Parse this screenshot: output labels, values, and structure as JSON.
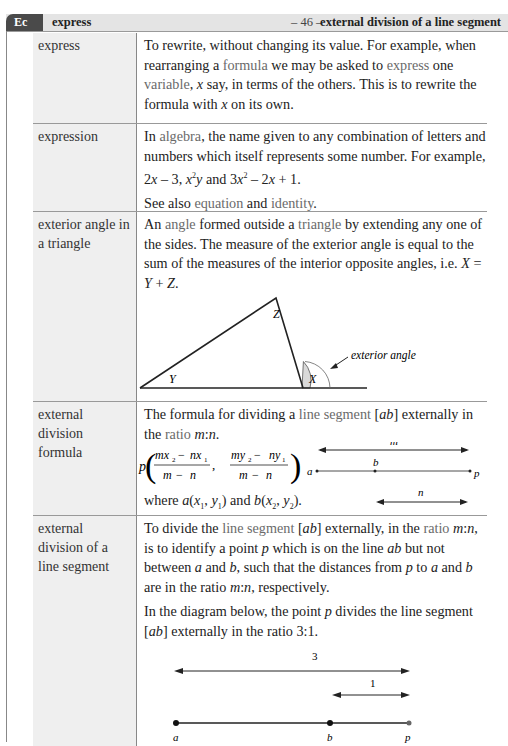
{
  "header": {
    "tab_label": "Ec",
    "left_word": "express",
    "page_number": "– 46 –",
    "right_word": "external division of a line segment"
  },
  "entries": [
    {
      "term": "express",
      "definition": "To rewrite, without changing its value. For example, when rearranging a formula we may be asked to express one variable, x say, in terms of the others. This is to rewrite the formula with x on its own.",
      "xrefs": [
        "formula",
        "express",
        "variable"
      ]
    },
    {
      "term": "expression",
      "definition": "In algebra, the name given to any combination of letters and numbers which itself represents some number. For example, 2x − 3, x²y and 3x² − 2x + 1.",
      "see_also": "See also equation and identity.",
      "xrefs": [
        "algebra",
        "equation",
        "identity"
      ]
    },
    {
      "term": "exterior angle in a triangle",
      "definition": "An angle formed outside a triangle by extending any one of the sides. The measure of the exterior angle is equal to the sum of the measures of the interior opposite angles, i.e. X = Y + Z.",
      "diagram": {
        "labels": [
          "Z",
          "Y",
          "X"
        ],
        "annotation": "exterior angle"
      },
      "xrefs": [
        "angle",
        "triangle"
      ]
    },
    {
      "term": "external division formula",
      "definition": "The formula for dividing a line segment [ab] externally in the ratio m:n.",
      "formula": "p((mx₂ − nx₁)/(m − n), (my₂ − ny₁)/(m − n))",
      "where": "where a(x₁, y₁) and b(x₂, y₂).",
      "diagram": {
        "labels": [
          "m",
          "a",
          "b",
          "p",
          "n"
        ]
      },
      "xrefs": [
        "line segment",
        "ratio"
      ]
    },
    {
      "term": "external division of a line segment",
      "definition": "To divide the line segment [ab] externally, in the ratio m:n, is to identify a point p which is on the line ab but not between a and b, such that the distances from p to a and b are in the ratio m:n, respectively.",
      "paragraph2": "In the diagram below, the point p divides the line segment [ab] externally in the ratio 3:1.",
      "diagram": {
        "labels": [
          "3",
          "1",
          "a",
          "b",
          "p"
        ]
      },
      "xrefs": [
        "line segment",
        "ratio"
      ]
    }
  ]
}
